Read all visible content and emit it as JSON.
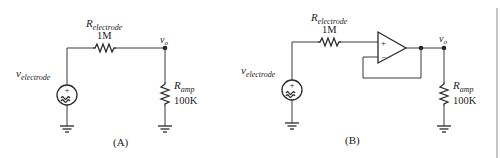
{
  "circuit_a": {
    "caption": "(A)",
    "source_label": "v",
    "source_sub": "electrode",
    "series_resistor": {
      "label": "R",
      "sub": "electrode",
      "value": "1M"
    },
    "load_resistor": {
      "label": "R",
      "sub": "amp",
      "value": "100K"
    },
    "output_node": {
      "label": "v",
      "sub": "o"
    },
    "source_polarity": "+"
  },
  "circuit_b": {
    "caption": "(B)",
    "source_label": "v",
    "source_sub": "electrode",
    "series_resistor": {
      "label": "R",
      "sub": "electrode",
      "value": "1M"
    },
    "load_resistor": {
      "label": "R",
      "sub": "amp",
      "value": "100K"
    },
    "output_node": {
      "label": "v",
      "sub": "o"
    },
    "source_polarity": "+",
    "opamp": {
      "plus": "+",
      "minus": "−",
      "config": "voltage follower"
    }
  },
  "colors": {
    "ink": "#2a2a2a",
    "background": "#ffffff",
    "border": "#b0b0b0"
  }
}
